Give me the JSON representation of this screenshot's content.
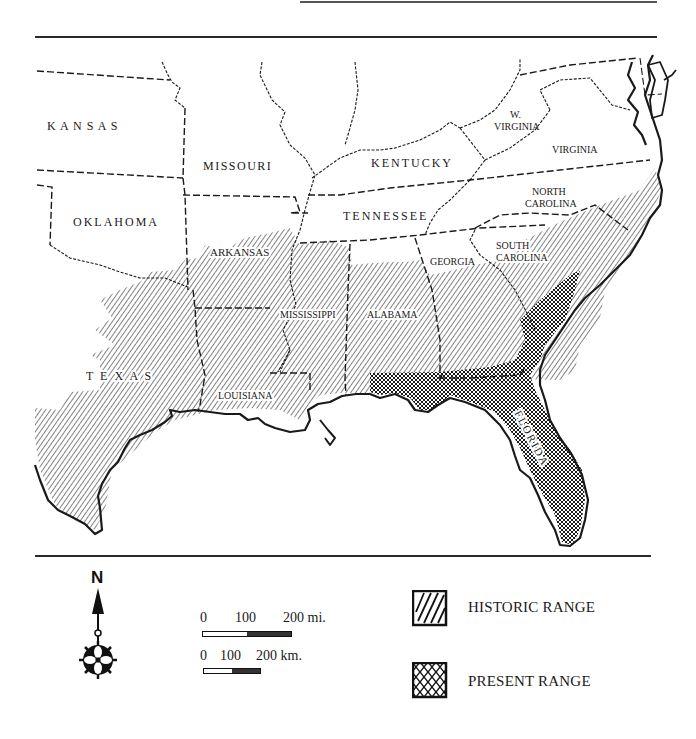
{
  "map": {
    "title": "",
    "states": {
      "kansas": "K A N S A S",
      "missouri": "MISSOURI",
      "oklahoma": "OKLAHOMA",
      "arkansas": "ARKANSAS",
      "kentucky": "KENTUCKY",
      "tennessee": "TENNESSEE",
      "w_virginia_1": "W.",
      "w_virginia_2": "VIRGINIA",
      "virginia": "VIRGINIA",
      "north_carolina_1": "NORTH",
      "north_carolina_2": "CAROLINA",
      "south_carolina_1": "SOUTH",
      "south_carolina_2": "CAROLINA",
      "georgia": "GEORGIA",
      "mississippi": "MISSISSIPPI",
      "alabama": "ALABAMA",
      "texas": "T E X A S",
      "louisiana": "LOUISIANA",
      "florida": "FLORIDA"
    },
    "colors": {
      "ink": "#1a1a1a",
      "background": "#ffffff"
    }
  },
  "compass": {
    "north_label": "N",
    "icon": "compass-rose-icon"
  },
  "scale_bars": {
    "miles": {
      "ticks": [
        "0",
        "100",
        "200 mi."
      ]
    },
    "kilometers": {
      "ticks": [
        "0",
        "100",
        "200 km."
      ]
    }
  },
  "legend": {
    "items": [
      {
        "label": "HISTORIC RANGE",
        "pattern": "diagonal-hatch"
      },
      {
        "label": "PRESENT RANGE",
        "pattern": "cross-hatch"
      }
    ]
  }
}
